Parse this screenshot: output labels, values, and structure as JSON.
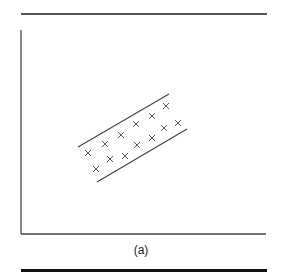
{
  "figure": {
    "caption": "(a)",
    "colors": {
      "axis": "#444444",
      "marker": "#555555",
      "boundary": "#444444",
      "rule_top": "#555555",
      "rule_bottom": "#111111"
    }
  },
  "chart_data": {
    "type": "scatter",
    "title": "",
    "xlabel": "",
    "ylabel": "",
    "grid": false,
    "legend": null,
    "marker": "x",
    "points_px": [
      [
        88,
        153
      ],
      [
        96,
        169
      ],
      [
        105,
        144
      ],
      [
        110,
        159
      ],
      [
        121,
        135
      ],
      [
        125,
        156
      ],
      [
        136,
        124
      ],
      [
        137,
        145
      ],
      [
        152,
        116
      ],
      [
        152,
        138
      ],
      [
        164,
        128
      ],
      [
        166,
        106
      ],
      [
        178,
        123
      ]
    ],
    "boundary_lines_px": [
      {
        "name": "upper-margin",
        "from": [
          78,
          147
        ],
        "to": [
          169,
          94
        ]
      },
      {
        "name": "lower-margin",
        "from": [
          97,
          182
        ],
        "to": [
          187,
          129
        ]
      }
    ],
    "axes_px": {
      "origin": [
        21,
        234
      ],
      "y_top": 30,
      "x_right": 266
    }
  }
}
